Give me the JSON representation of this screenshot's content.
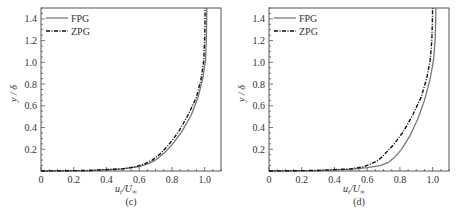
{
  "chart_data": [
    {
      "panel_label": "(c)",
      "type": "line",
      "xlabel": "u_t/U_∞",
      "ylabel": "y/δ",
      "xlim": [
        0,
        1.1
      ],
      "ylim": [
        0,
        1.5
      ],
      "xticks": [
        "0",
        "0.2",
        "0.4",
        "0.6",
        "0.8",
        "1.0"
      ],
      "yticks": [
        "0.2",
        "0.4",
        "0.6",
        "0.8",
        "1.0",
        "1.2",
        "1.4"
      ],
      "grid": false,
      "legend_position": "upper left",
      "series": [
        {
          "name": "FPG",
          "style": "solid",
          "color": "#777777",
          "x": [
            0.0,
            0.3,
            0.5,
            0.6,
            0.66,
            0.7,
            0.75,
            0.8,
            0.86,
            0.92,
            0.96,
            0.99,
            1.005,
            1.01,
            1.012,
            1.013
          ],
          "y": [
            0.0,
            0.005,
            0.02,
            0.04,
            0.07,
            0.1,
            0.16,
            0.24,
            0.36,
            0.52,
            0.68,
            0.86,
            1.02,
            1.2,
            1.35,
            1.5
          ]
        },
        {
          "name": "ZPG",
          "style": "dashdot",
          "color": "#111111",
          "x": [
            0.0,
            0.3,
            0.5,
            0.58,
            0.64,
            0.68,
            0.73,
            0.78,
            0.84,
            0.9,
            0.95,
            0.98,
            0.995,
            1.0,
            1.002,
            1.003
          ],
          "y": [
            0.0,
            0.005,
            0.02,
            0.04,
            0.07,
            0.1,
            0.16,
            0.24,
            0.36,
            0.52,
            0.68,
            0.86,
            1.02,
            1.2,
            1.35,
            1.5
          ]
        }
      ]
    },
    {
      "panel_label": "(d)",
      "type": "line",
      "xlabel": "u_t/U_∞",
      "ylabel": "y/δ",
      "xlim": [
        0,
        1.1
      ],
      "ylim": [
        0,
        1.5
      ],
      "xticks": [
        "0",
        "0.2",
        "0.4",
        "0.6",
        "0.8",
        "1.0"
      ],
      "yticks": [
        "0.2",
        "0.4",
        "0.6",
        "0.8",
        "1.0",
        "1.2",
        "1.4"
      ],
      "grid": false,
      "legend_position": "upper left",
      "series": [
        {
          "name": "FPG",
          "style": "solid",
          "color": "#777777",
          "x": [
            0.0,
            0.3,
            0.5,
            0.6,
            0.68,
            0.73,
            0.77,
            0.81,
            0.86,
            0.91,
            0.95,
            0.985,
            1.005,
            1.015,
            1.018,
            1.02
          ],
          "y": [
            0.0,
            0.005,
            0.015,
            0.03,
            0.05,
            0.08,
            0.13,
            0.2,
            0.32,
            0.48,
            0.65,
            0.85,
            1.02,
            1.2,
            1.35,
            1.5
          ]
        },
        {
          "name": "ZPG",
          "style": "dashdot",
          "color": "#111111",
          "x": [
            0.0,
            0.3,
            0.5,
            0.58,
            0.63,
            0.67,
            0.71,
            0.76,
            0.82,
            0.88,
            0.93,
            0.965,
            0.985,
            0.995,
            0.998,
            1.0
          ],
          "y": [
            0.0,
            0.005,
            0.02,
            0.04,
            0.07,
            0.1,
            0.16,
            0.24,
            0.36,
            0.52,
            0.68,
            0.86,
            1.02,
            1.2,
            1.35,
            1.5
          ]
        }
      ]
    }
  ],
  "panels": [
    {
      "caption": "(c)",
      "xlabel_main": "u",
      "xlabel_sub": "t",
      "xlabel_den": "/U",
      "xlabel_den_sub": "∞",
      "ylabel": "y / δ",
      "legend": [
        {
          "label": "FPG"
        },
        {
          "label": "ZPG"
        }
      ]
    },
    {
      "caption": "(d)",
      "xlabel_main": "u",
      "xlabel_sub": "t",
      "xlabel_den": "/U",
      "xlabel_den_sub": "∞",
      "ylabel": "y / δ",
      "legend": [
        {
          "label": "FPG"
        },
        {
          "label": "ZPG"
        }
      ]
    }
  ]
}
